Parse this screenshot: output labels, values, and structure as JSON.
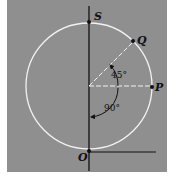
{
  "diagram": {
    "type": "circle-geometry",
    "background": "#8f8f8f",
    "circle_color": "#f2f2f2",
    "line_color": "#111111",
    "points": [
      {
        "id": "S",
        "label": "S",
        "position": "top of circle"
      },
      {
        "id": "Q",
        "label": "Q",
        "position": "upper right on circle, 45° from horizontal"
      },
      {
        "id": "P",
        "label": "P",
        "position": "right of circle on horizontal radius"
      },
      {
        "id": "O",
        "label": "O",
        "position": "bottom of circle, origin"
      }
    ],
    "angles": [
      {
        "label": "45°",
        "between": "horizontal radius to P and radius to Q"
      },
      {
        "label": "90°",
        "between": "vertical axis and horizontal radius to P"
      }
    ]
  },
  "labels": {
    "S": "S",
    "Q": "Q",
    "P": "P",
    "O": "O",
    "angle_45": "45°",
    "angle_90": "90°"
  }
}
